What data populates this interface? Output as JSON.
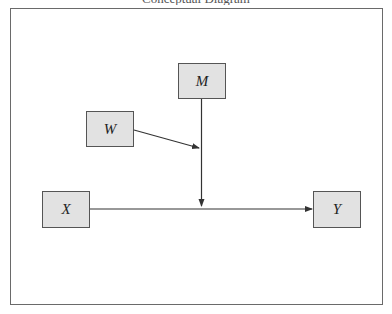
{
  "diagram": {
    "title_clipped": "Conceptual Diagram",
    "colors": {
      "node_fill": "#e2e2e2",
      "node_border": "#555555",
      "edge": "#333333",
      "frame_border": "#6a6a6a"
    },
    "nodes": [
      {
        "id": "M",
        "label": "M",
        "x": 178,
        "y": 63,
        "w": 48,
        "h": 36
      },
      {
        "id": "W",
        "label": "W",
        "x": 86,
        "y": 111,
        "w": 48,
        "h": 36
      },
      {
        "id": "X",
        "label": "X",
        "x": 42,
        "y": 191,
        "w": 48,
        "h": 37
      },
      {
        "id": "Y",
        "label": "Y",
        "x": 313,
        "y": 191,
        "w": 48,
        "h": 37
      }
    ],
    "edges": [
      {
        "from": "X",
        "to": "Y",
        "type": "direct-path"
      },
      {
        "from": "M",
        "to": "X→Y path",
        "type": "moderation"
      },
      {
        "from": "W",
        "to": "M→(X→Y) path",
        "type": "moderated-moderation"
      }
    ]
  }
}
